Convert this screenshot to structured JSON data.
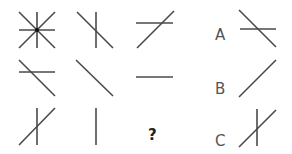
{
  "puzzle": {
    "question_mark": "?",
    "grid": [
      [
        {
          "id": "r1c1",
          "lines": [
            "horizontal",
            "vertical",
            "diagonal-down",
            "diagonal-up"
          ],
          "center_dot": true
        },
        {
          "id": "r1c2",
          "lines": [
            "vertical",
            "diagonal-down"
          ]
        },
        {
          "id": "r1c3",
          "lines": [
            "horizontal",
            "diagonal-up"
          ]
        }
      ],
      [
        {
          "id": "r2c1",
          "lines": [
            "horizontal",
            "diagonal-down"
          ]
        },
        {
          "id": "r2c2",
          "lines": [
            "diagonal-down"
          ]
        },
        {
          "id": "r2c3",
          "lines": [
            "horizontal"
          ]
        }
      ],
      [
        {
          "id": "r3c1",
          "lines": [
            "vertical",
            "diagonal-up"
          ]
        },
        {
          "id": "r3c2",
          "lines": [
            "vertical"
          ]
        },
        {
          "id": "r3c3",
          "lines": [],
          "missing": true
        }
      ]
    ],
    "options": [
      {
        "label": "A",
        "lines": [
          "horizontal",
          "diagonal-down"
        ]
      },
      {
        "label": "B",
        "lines": [
          "diagonal-up"
        ]
      },
      {
        "label": "C",
        "lines": [
          "vertical",
          "diagonal-up"
        ]
      }
    ],
    "colors": {
      "line": "#4a4a4a",
      "label": "#555555",
      "background": "#ffffff"
    }
  }
}
